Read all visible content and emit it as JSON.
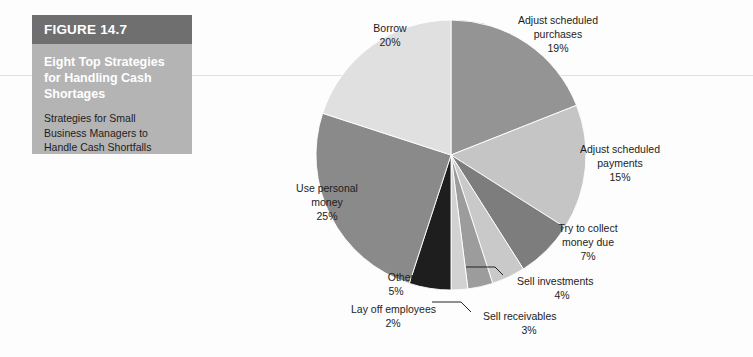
{
  "figure": {
    "header_label": "FIGURE 14.7",
    "title": "Eight Top Strategies for Handling Cash Shortages",
    "subtitle": "Strategies for Small Business Managers to Handle Cash Shortfalls",
    "header_bg": "#6f6f6f",
    "body_bg": "#b4b4b4"
  },
  "chart_data": {
    "type": "pie",
    "title": "Eight Top Strategies for Handling Cash Shortages",
    "xlabel": "",
    "ylabel": "",
    "legend_position": "none",
    "grid": false,
    "start_angle_deg": 0,
    "direction": "clockwise",
    "units": "percent",
    "categories": [
      "Adjust scheduled purchases",
      "Adjust scheduled payments",
      "Try to collect money due",
      "Sell investments",
      "Sell receivables",
      "Lay off employees",
      "Other",
      "Use personal money",
      "Borrow"
    ],
    "values": [
      19,
      15,
      7,
      4,
      3,
      2,
      5,
      25,
      20
    ],
    "colors": [
      "#949494",
      "#c5c5c5",
      "#7d7d7d",
      "#c9c9c9",
      "#9c9c9c",
      "#d2d2d2",
      "#1e1e1e",
      "#8a8a8a",
      "#e0e0e0"
    ],
    "slices": [
      {
        "label": "Adjust scheduled purchases",
        "value": 19,
        "value_text": "19%",
        "color": "#949494"
      },
      {
        "label": "Adjust scheduled payments",
        "value": 15,
        "value_text": "15%",
        "color": "#c5c5c5"
      },
      {
        "label": "Try to collect money due",
        "value": 7,
        "value_text": "7%",
        "color": "#7d7d7d"
      },
      {
        "label": "Sell investments",
        "value": 4,
        "value_text": "4%",
        "color": "#c9c9c9"
      },
      {
        "label": "Sell receivables",
        "value": 3,
        "value_text": "3%",
        "color": "#9c9c9c"
      },
      {
        "label": "Lay off employees",
        "value": 2,
        "value_text": "2%",
        "color": "#d2d2d2"
      },
      {
        "label": "Other",
        "value": 5,
        "value_text": "5%",
        "color": "#1e1e1e"
      },
      {
        "label": "Use personal money",
        "value": 25,
        "value_text": "25%",
        "color": "#8a8a8a"
      },
      {
        "label": "Borrow",
        "value": 20,
        "value_text": "20%",
        "color": "#e0e0e0"
      }
    ]
  },
  "labels": {
    "adjust_purchases_l1": "Adjust scheduled",
    "adjust_purchases_l2": "purchases",
    "adjust_purchases_pct": "19%",
    "adjust_payments_l1": "Adjust scheduled",
    "adjust_payments_l2": "payments",
    "adjust_payments_pct": "15%",
    "collect_l1": "Try to collect",
    "collect_l2": "money due",
    "collect_pct": "7%",
    "investments_l1": "Sell investments",
    "investments_pct": "4%",
    "receivables_l1": "Sell receivables",
    "receivables_pct": "3%",
    "layoff_l1": "Lay off employees",
    "layoff_pct": "2%",
    "other_l1": "Other",
    "other_pct": "5%",
    "personal_l1": "Use personal",
    "personal_l2": "money",
    "personal_pct": "25%",
    "borrow_l1": "Borrow",
    "borrow_pct": "20%"
  }
}
